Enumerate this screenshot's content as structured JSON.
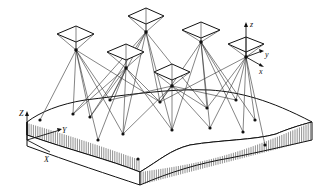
{
  "figure": {
    "colors": {
      "line": "#111111",
      "background": "#ffffff"
    },
    "ground_axes": {
      "z_label": "Z",
      "y_label": "Y",
      "x_label": "X"
    },
    "camera_axes": {
      "z_label": "z",
      "y_label": "y",
      "x_label": "x"
    },
    "cameras": [
      {
        "id": "cam-1",
        "frame": [
          [
            57,
            34
          ],
          [
            76,
            26
          ],
          [
            94,
            34
          ],
          [
            76,
            42
          ]
        ],
        "center": [
          76,
          50
        ]
      },
      {
        "id": "cam-2",
        "frame": [
          [
            128,
            16
          ],
          [
            146,
            8
          ],
          [
            164,
            16
          ],
          [
            146,
            24
          ]
        ],
        "center": [
          146,
          32
        ]
      },
      {
        "id": "cam-3",
        "frame": [
          [
            107,
            52
          ],
          [
            126,
            44
          ],
          [
            144,
            52
          ],
          [
            126,
            60
          ]
        ],
        "center": [
          126,
          68
        ]
      },
      {
        "id": "cam-4",
        "frame": [
          [
            182,
            30
          ],
          [
            201,
            22
          ],
          [
            220,
            30
          ],
          [
            201,
            38
          ]
        ],
        "center": [
          201,
          42
        ]
      },
      {
        "id": "cam-5",
        "frame": [
          [
            228,
            44
          ],
          [
            246,
            37
          ],
          [
            264,
            44
          ],
          [
            246,
            52
          ]
        ],
        "center": [
          246,
          57
        ]
      },
      {
        "id": "cam-6",
        "frame": [
          [
            154,
            72
          ],
          [
            172,
            64
          ],
          [
            190,
            72
          ],
          [
            172,
            80
          ]
        ],
        "center": [
          172,
          86
        ]
      }
    ],
    "ground_points": [
      [
        40,
        120
      ],
      [
        73,
        114
      ],
      [
        110,
        100
      ],
      [
        123,
        134
      ],
      [
        138,
        159
      ],
      [
        172,
        130
      ],
      [
        207,
        108
      ],
      [
        210,
        128
      ],
      [
        243,
        132
      ],
      [
        236,
        100
      ],
      [
        265,
        145
      ],
      [
        98,
        140
      ],
      [
        90,
        117
      ],
      [
        255,
        120
      ],
      [
        160,
        102
      ]
    ]
  }
}
